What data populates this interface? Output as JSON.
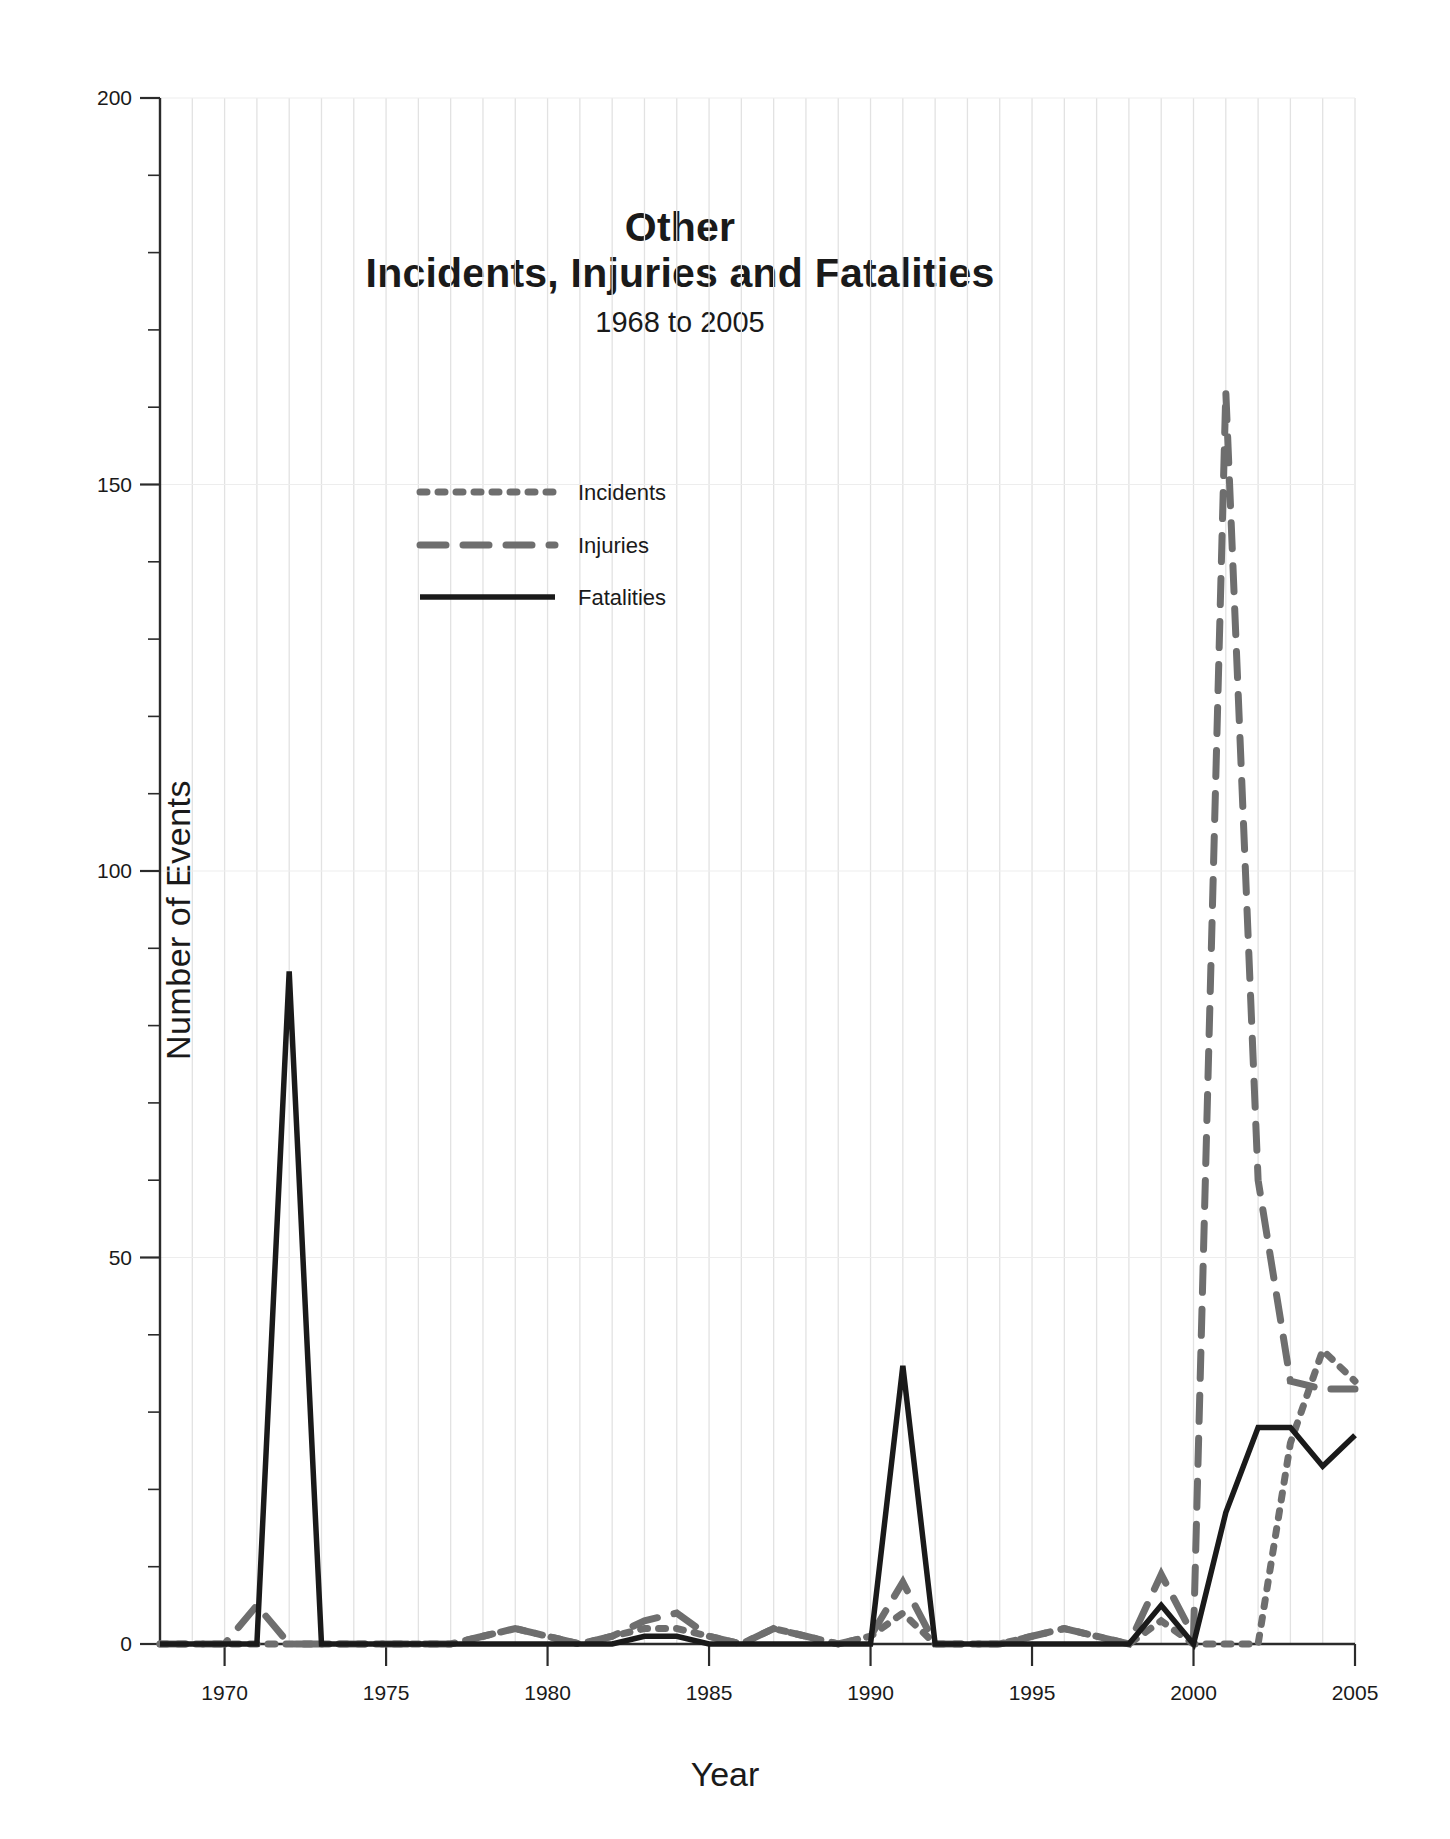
{
  "chart_data": {
    "type": "line",
    "title": "Other",
    "title_line2": "Incidents, Injuries and Fatalities",
    "subtitle": "1968 to 2005",
    "xlabel": "Year",
    "ylabel": "Number of Events",
    "xlim": [
      1968,
      2005
    ],
    "ylim": [
      0,
      200
    ],
    "yticks": [
      0,
      50,
      100,
      150,
      200
    ],
    "ytick_labels": [
      "0",
      "50",
      "100",
      "150",
      "200"
    ],
    "y_minor_tick_step": 10,
    "xticks": [
      1970,
      1975,
      1980,
      1985,
      1990,
      1995,
      2000,
      2005
    ],
    "xtick_labels": [
      "1970",
      "1975",
      "1980",
      "1985",
      "1990",
      "1995",
      "2000",
      "2005"
    ],
    "grid": "vertical gridlines at every year, light horizontal gridlines at major y ticks",
    "legend_position": "upper center-left inside plot",
    "x": [
      1968,
      1969,
      1970,
      1971,
      1972,
      1973,
      1974,
      1975,
      1976,
      1977,
      1978,
      1979,
      1980,
      1981,
      1982,
      1983,
      1984,
      1985,
      1986,
      1987,
      1988,
      1989,
      1990,
      1991,
      1992,
      1993,
      1994,
      1995,
      1996,
      1997,
      1998,
      1999,
      2000,
      2001,
      2002,
      2003,
      2004,
      2005
    ],
    "series": [
      {
        "name": "Incidents",
        "style": "dotted",
        "color": "#6e6e6e",
        "values": [
          0,
          0,
          0,
          0,
          0,
          0,
          0,
          0,
          0,
          0,
          1,
          2,
          1,
          0,
          1,
          2,
          2,
          1,
          0,
          2,
          1,
          0,
          1,
          4,
          0,
          0,
          0,
          1,
          2,
          1,
          0,
          3,
          0,
          0,
          0,
          26,
          38,
          34
        ]
      },
      {
        "name": "Injuries",
        "style": "dashed",
        "color": "#6e6e6e",
        "values": [
          0,
          0,
          0,
          5,
          0,
          0,
          0,
          0,
          0,
          0,
          1,
          2,
          1,
          0,
          1,
          3,
          4,
          1,
          0,
          2,
          1,
          0,
          1,
          8,
          0,
          0,
          0,
          1,
          2,
          1,
          0,
          9,
          1,
          162,
          60,
          34,
          33,
          33
        ]
      },
      {
        "name": "Fatalities",
        "style": "solid",
        "color": "#1a1a1a",
        "values": [
          0,
          0,
          0,
          0,
          87,
          0,
          0,
          0,
          0,
          0,
          0,
          0,
          0,
          0,
          0,
          1,
          1,
          0,
          0,
          0,
          0,
          0,
          0,
          36,
          0,
          0,
          0,
          0,
          0,
          0,
          0,
          5,
          0,
          17,
          28,
          28,
          23,
          27
        ]
      }
    ]
  },
  "legend": {
    "entries": [
      {
        "label": "Incidents"
      },
      {
        "label": "Injuries"
      },
      {
        "label": "Fatalities"
      }
    ]
  },
  "colors": {
    "series_gray": "#6e6e6e",
    "series_black": "#1a1a1a",
    "gridline": "#e2e2e2",
    "axis": "#2b2b2b",
    "background": "#ffffff"
  }
}
